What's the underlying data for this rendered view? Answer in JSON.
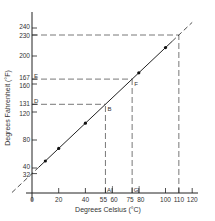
{
  "chart_data": {
    "type": "line",
    "title": "",
    "xlabel": "Degrees Celsius (°C)",
    "ylabel": "Degrees Fahrenheit (°F)",
    "xlim": [
      0,
      120
    ],
    "ylim": [
      0,
      250
    ],
    "grid": false,
    "legend": "none",
    "x_ticks": [
      {
        "value": 0,
        "label": "0"
      },
      {
        "value": 20,
        "label": "20"
      },
      {
        "value": 40,
        "label": "40"
      },
      {
        "value": 55,
        "label": "55"
      },
      {
        "value": 60,
        "label": "60"
      },
      {
        "value": 75,
        "label": "75"
      },
      {
        "value": 80,
        "label": "80"
      },
      {
        "value": 100,
        "label": "100"
      },
      {
        "value": 110,
        "label": "110"
      },
      {
        "value": 120,
        "label": "120"
      }
    ],
    "y_ticks": [
      {
        "value": 32,
        "label": "32"
      },
      {
        "value": 40,
        "label": "40"
      },
      {
        "value": 80,
        "label": "80"
      },
      {
        "value": 120,
        "label": "120"
      },
      {
        "value": 131,
        "label": "131"
      },
      {
        "value": 160,
        "label": "160"
      },
      {
        "value": 167,
        "label": "167"
      },
      {
        "value": 200,
        "label": "200"
      },
      {
        "value": 230,
        "label": "230"
      },
      {
        "value": 240,
        "label": "240"
      }
    ],
    "series": [
      {
        "name": "F = 9/5 C + 32",
        "x": [
          10,
          20,
          40,
          80,
          100
        ],
        "y": [
          50,
          68,
          104,
          176,
          212
        ]
      }
    ],
    "line_extent": {
      "c_start": -15,
      "c_end": 120
    },
    "annotations": [
      {
        "label": "A",
        "x": 55,
        "y": 0,
        "kind": "x-axis-marker"
      },
      {
        "label": "B",
        "x": 55,
        "y": 131,
        "kind": "point"
      },
      {
        "label": "D",
        "x": 0,
        "y": 131,
        "kind": "y-axis-marker"
      },
      {
        "label": "E",
        "x": 0,
        "y": 167,
        "kind": "y-axis-marker"
      },
      {
        "label": "F",
        "x": 75,
        "y": 167,
        "kind": "point"
      },
      {
        "label": "G",
        "x": 75,
        "y": 0,
        "kind": "x-axis-marker"
      }
    ],
    "guides": [
      {
        "from": [
          55,
          0
        ],
        "to": [
          55,
          131
        ]
      },
      {
        "from": [
          0,
          131
        ],
        "to": [
          55,
          131
        ]
      },
      {
        "from": [
          75,
          0
        ],
        "to": [
          75,
          167
        ]
      },
      {
        "from": [
          0,
          167
        ],
        "to": [
          75,
          167
        ]
      },
      {
        "from": [
          110,
          0
        ],
        "to": [
          110,
          230
        ]
      },
      {
        "from": [
          0,
          230
        ],
        "to": [
          110,
          230
        ]
      }
    ]
  }
}
